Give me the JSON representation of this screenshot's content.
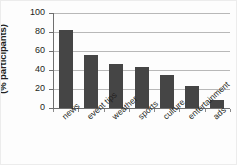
{
  "chart_data": {
    "type": "bar",
    "title": "",
    "xlabel": "",
    "ylabel": "Interest in content-types (% participants)",
    "ylabel_lines": [
      "Interest in content-types",
      "(% participants)"
    ],
    "categories": [
      "news",
      "event tips",
      "weather",
      "sports",
      "culture",
      "entertainment",
      "ads"
    ],
    "values": [
      82,
      56,
      46,
      43,
      35,
      23,
      8
    ],
    "ylim": [
      0,
      100
    ],
    "yticks": [
      0,
      20,
      40,
      60,
      80,
      100
    ],
    "ytick_labels": [
      "0",
      "20",
      "40",
      "60",
      "80",
      "100"
    ],
    "grid": true,
    "grid_axis": "y",
    "legend": false,
    "bar_color": "#454545",
    "grid_color": "#b8b8b8",
    "axis_color": "#6f6f6f",
    "text_color": "#231f20",
    "background": "#ffffff"
  }
}
